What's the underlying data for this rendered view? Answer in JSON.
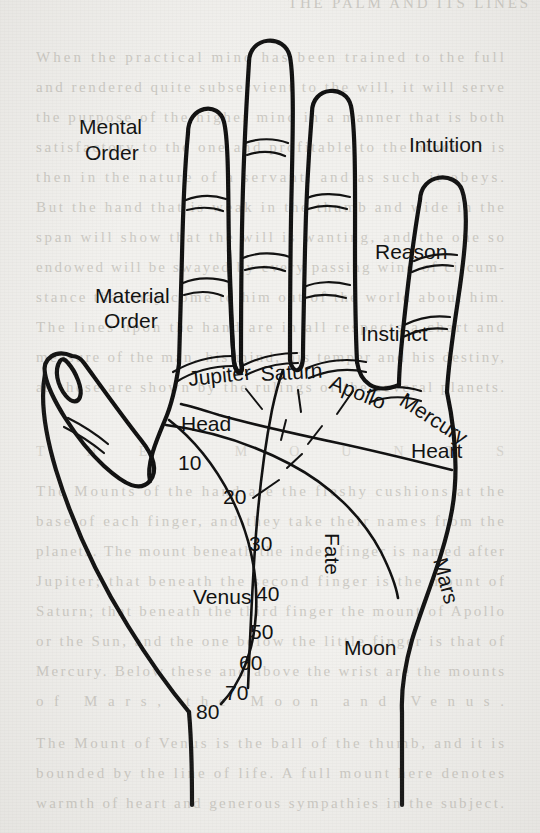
{
  "figure": {
    "kind": "palmistry-hand-chart",
    "ink_color": "#111111",
    "paper_color": "#f2f1ee",
    "bleed_text_color": "#b9b6ae"
  },
  "labels": {
    "mental_order": "Mental\nOrder",
    "mental_order_line1": "Mental",
    "mental_order_line2": "Order",
    "material_order_line1": "Material",
    "material_order_line2": "Order",
    "intuition": "Intuition",
    "reason": "Reason",
    "instinct": "Instinct"
  },
  "mounts": [
    {
      "id": "jupiter",
      "label": "Jupiter"
    },
    {
      "id": "saturn",
      "label": "Saturn"
    },
    {
      "id": "apollo",
      "label": "Apollo"
    },
    {
      "id": "mercury",
      "label": "Mercury"
    },
    {
      "id": "venus",
      "label": "Venus"
    },
    {
      "id": "moon",
      "label": "Moon"
    },
    {
      "id": "mars",
      "label": "Mars"
    }
  ],
  "lines": [
    {
      "id": "head",
      "label": "Head"
    },
    {
      "id": "heart",
      "label": "Heart"
    },
    {
      "id": "fate",
      "label": "Fate"
    }
  ],
  "life_line_ages": [
    {
      "value": "10"
    },
    {
      "value": "20"
    },
    {
      "value": "30"
    },
    {
      "value": "40"
    },
    {
      "value": "50"
    },
    {
      "value": "60"
    },
    {
      "value": "70"
    },
    {
      "value": "80"
    }
  ],
  "age_scale": {
    "min": "10",
    "max": "80",
    "step": "10",
    "along": "life-line"
  },
  "background_bleed": {
    "note": "faint illegible show-through text from the reverse page",
    "rows": [
      "When the  ",
      "  will  ",
      "  ",
      "  ",
      "  ",
      "  ",
      "  ",
      "  ",
      "  ",
      "  ",
      "  ",
      "  ",
      "  ",
      "  ",
      "  ",
      "  ",
      "  ",
      "  "
    ]
  }
}
